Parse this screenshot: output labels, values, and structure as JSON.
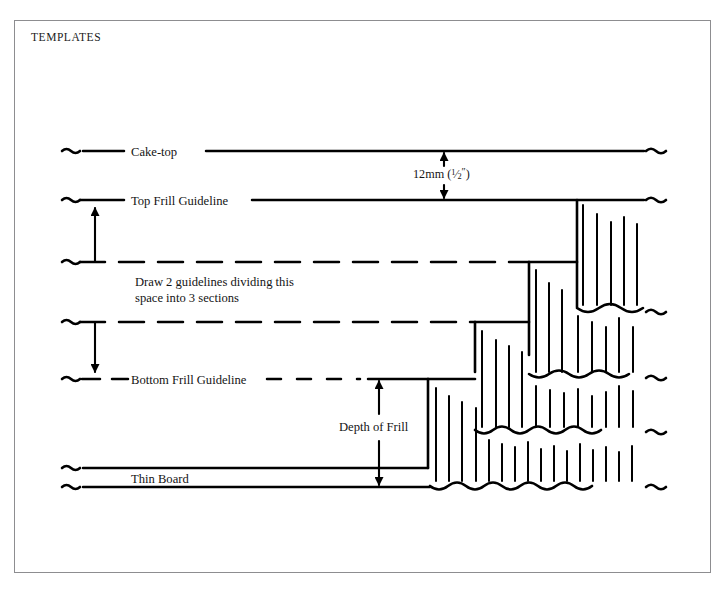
{
  "page": {
    "section_title": "TEMPLATES",
    "ghost_header_left": "",
    "ghost_header_right": ""
  },
  "labels": {
    "cake_top": "Cake-top",
    "top_frill_guideline": "Top Frill Guideline",
    "bottom_frill_guideline": "Bottom Frill Guideline",
    "thin_board": "Thin Board",
    "depth_of_frill": "Depth of Frill",
    "instruction_line1": "Draw 2 guidelines dividing this",
    "instruction_line2": "space into 3 sections"
  },
  "dimension": {
    "value": "12mm",
    "imperial_open": "(",
    "numerator": "1",
    "slash": "⁄",
    "denominator": "2",
    "double_prime": "″",
    "imperial_close": ")",
    "full_text": "12mm (1/2\")"
  },
  "colors": {
    "ink": "#000000",
    "frame_border": "#8d8d90",
    "paper": "#ffffff",
    "text": "#141414"
  },
  "diagram": {
    "name": "cake-frill-template-diagram",
    "guideline_rows": [
      {
        "id": "cake-top",
        "y": 151,
        "style": "solid"
      },
      {
        "id": "top-frill",
        "y": 200,
        "style": "solid"
      },
      {
        "id": "division-1",
        "y": 262,
        "style": "dashed"
      },
      {
        "id": "division-2",
        "y": 322,
        "style": "dashed"
      },
      {
        "id": "bottom-frill",
        "y": 379,
        "style": "dashed"
      },
      {
        "id": "board-top",
        "y": 468,
        "style": "solid"
      },
      {
        "id": "board-bottom",
        "y": 487,
        "style": "solid"
      }
    ],
    "step_x_positions": [
      428,
      475,
      529,
      577
    ],
    "frill_tiers": 4,
    "arrows": [
      {
        "id": "top-section-arrow",
        "heads": "up",
        "x": 95,
        "y1": 262,
        "y2": 200
      },
      {
        "id": "bottom-section-arrow",
        "heads": "down",
        "x": 95,
        "y1": 322,
        "y2": 379
      },
      {
        "id": "twelve-mm-arrow",
        "heads": "both",
        "x": 444,
        "y1": 151,
        "y2": 200
      },
      {
        "id": "depth-of-frill-arrow",
        "heads": "both",
        "x": 379,
        "y1": 379,
        "y2": 487
      }
    ]
  }
}
